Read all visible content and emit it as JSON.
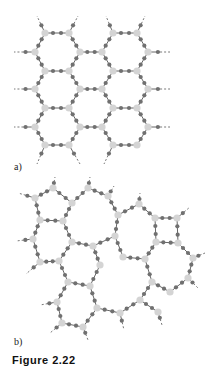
{
  "figure": {
    "panel_a_label": "a)",
    "panel_b_label": "b)",
    "caption": "Figure 2.22",
    "colors": {
      "bond": "#555555",
      "bridge_atom": "#707070",
      "node_atom": "#d4d4d4",
      "background": "#ffffff"
    },
    "panel_a": {
      "description": "crystalline hexagonal network",
      "nodes": [
        [
          45,
          33
        ],
        [
          69,
          33
        ],
        [
          113,
          33
        ],
        [
          137,
          33
        ],
        [
          35,
          52
        ],
        [
          80,
          52
        ],
        [
          102,
          52
        ],
        [
          148,
          52
        ],
        [
          45,
          71
        ],
        [
          69,
          71
        ],
        [
          113,
          71
        ],
        [
          137,
          71
        ],
        [
          35,
          89
        ],
        [
          80,
          89
        ],
        [
          102,
          89
        ],
        [
          148,
          89
        ],
        [
          45,
          108
        ],
        [
          69,
          108
        ],
        [
          113,
          108
        ],
        [
          137,
          108
        ],
        [
          35,
          127
        ],
        [
          80,
          127
        ],
        [
          102,
          127
        ],
        [
          148,
          127
        ],
        [
          45,
          145
        ],
        [
          69,
          145
        ],
        [
          113,
          145
        ],
        [
          137,
          145
        ]
      ],
      "edges": [
        [
          0,
          1
        ],
        [
          2,
          3
        ],
        [
          0,
          4
        ],
        [
          1,
          5
        ],
        [
          2,
          6
        ],
        [
          3,
          7
        ],
        [
          5,
          6
        ],
        [
          4,
          8
        ],
        [
          5,
          9
        ],
        [
          6,
          10
        ],
        [
          7,
          11
        ],
        [
          8,
          9
        ],
        [
          10,
          11
        ],
        [
          8,
          12
        ],
        [
          9,
          13
        ],
        [
          10,
          14
        ],
        [
          11,
          15
        ],
        [
          13,
          14
        ],
        [
          12,
          16
        ],
        [
          13,
          17
        ],
        [
          14,
          18
        ],
        [
          15,
          19
        ],
        [
          16,
          17
        ],
        [
          18,
          19
        ],
        [
          16,
          20
        ],
        [
          17,
          21
        ],
        [
          18,
          22
        ],
        [
          19,
          23
        ],
        [
          21,
          22
        ],
        [
          20,
          24
        ],
        [
          21,
          25
        ],
        [
          22,
          26
        ],
        [
          23,
          27
        ],
        [
          24,
          25
        ],
        [
          26,
          27
        ]
      ],
      "stubs": [
        [
          0,
          37,
          16
        ],
        [
          1,
          78,
          16
        ],
        [
          2,
          106,
          16
        ],
        [
          3,
          145,
          16
        ],
        [
          4,
          14,
          52
        ],
        [
          7,
          170,
          52
        ],
        [
          12,
          14,
          89
        ],
        [
          15,
          170,
          89
        ],
        [
          20,
          14,
          127
        ],
        [
          23,
          170,
          127
        ],
        [
          24,
          37,
          164
        ],
        [
          25,
          80,
          164
        ],
        [
          26,
          104,
          164
        ]
      ]
    },
    "panel_b": {
      "description": "amorphous (random) network",
      "nodes": [
        [
          53,
          188
        ],
        [
          88,
          188
        ],
        [
          35,
          198
        ],
        [
          72,
          203
        ],
        [
          108,
          196
        ],
        [
          139,
          204
        ],
        [
          40,
          220
        ],
        [
          63,
          221
        ],
        [
          118,
          215
        ],
        [
          155,
          218
        ],
        [
          177,
          218
        ],
        [
          33,
          239
        ],
        [
          72,
          242
        ],
        [
          93,
          246
        ],
        [
          115,
          236
        ],
        [
          156,
          242
        ],
        [
          178,
          243
        ],
        [
          123,
          257
        ],
        [
          145,
          259
        ],
        [
          193,
          258
        ],
        [
          40,
          262
        ],
        [
          59,
          261
        ],
        [
          100,
          265
        ],
        [
          188,
          278
        ],
        [
          68,
          282
        ],
        [
          90,
          286
        ],
        [
          152,
          282
        ],
        [
          170,
          292
        ],
        [
          57,
          302
        ],
        [
          97,
          308
        ],
        [
          120,
          313
        ],
        [
          140,
          300
        ],
        [
          158,
          312
        ],
        [
          62,
          323
        ],
        [
          83,
          327
        ]
      ],
      "edges": [
        [
          0,
          2
        ],
        [
          0,
          3
        ],
        [
          1,
          3
        ],
        [
          1,
          4
        ],
        [
          4,
          8
        ],
        [
          8,
          5
        ],
        [
          2,
          6
        ],
        [
          3,
          7
        ],
        [
          6,
          7
        ],
        [
          6,
          11
        ],
        [
          7,
          12
        ],
        [
          12,
          13
        ],
        [
          13,
          14
        ],
        [
          14,
          8
        ],
        [
          14,
          17
        ],
        [
          17,
          18
        ],
        [
          13,
          22
        ],
        [
          5,
          9
        ],
        [
          9,
          10
        ],
        [
          9,
          15
        ],
        [
          10,
          16
        ],
        [
          15,
          16
        ],
        [
          16,
          19
        ],
        [
          18,
          15
        ],
        [
          11,
          20
        ],
        [
          20,
          21
        ],
        [
          21,
          12
        ],
        [
          21,
          24
        ],
        [
          24,
          25
        ],
        [
          25,
          22
        ],
        [
          24,
          28
        ],
        [
          25,
          29
        ],
        [
          28,
          33
        ],
        [
          33,
          34
        ],
        [
          34,
          29
        ],
        [
          29,
          30
        ],
        [
          30,
          31
        ],
        [
          31,
          26
        ],
        [
          26,
          18
        ],
        [
          26,
          27
        ],
        [
          27,
          23
        ],
        [
          23,
          19
        ],
        [
          31,
          32
        ]
      ],
      "stubs": [
        [
          0,
          55,
          177
        ],
        [
          1,
          90,
          177
        ],
        [
          2,
          18,
          193
        ],
        [
          4,
          114,
          186
        ],
        [
          5,
          140,
          193
        ],
        [
          10,
          190,
          207
        ],
        [
          11,
          16,
          241
        ],
        [
          19,
          205,
          253
        ],
        [
          20,
          26,
          274
        ],
        [
          23,
          198,
          288
        ],
        [
          28,
          40,
          305
        ],
        [
          32,
          162,
          325
        ],
        [
          30,
          124,
          330
        ],
        [
          33,
          50,
          333
        ],
        [
          34,
          88,
          340
        ]
      ]
    }
  }
}
